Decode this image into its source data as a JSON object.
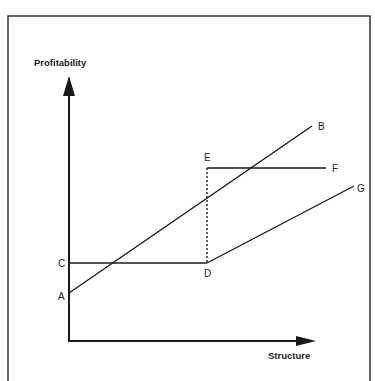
{
  "caption": "",
  "diagram": {
    "y_axis_label": "Profitability",
    "x_axis_label": "Structure",
    "points": {
      "A": {
        "label": "A"
      },
      "B": {
        "label": "B"
      },
      "C": {
        "label": "C"
      },
      "D": {
        "label": "D"
      },
      "E": {
        "label": "E"
      },
      "F": {
        "label": "F"
      },
      "G": {
        "label": "G"
      }
    },
    "lines": [
      {
        "id": "AB",
        "from": "A",
        "to": "B",
        "style": "solid"
      },
      {
        "id": "CD",
        "from": "C",
        "to": "D",
        "style": "solid"
      },
      {
        "id": "DG",
        "from": "D",
        "to": "G",
        "style": "solid"
      },
      {
        "id": "EF",
        "from": "E",
        "to": "F",
        "style": "solid"
      },
      {
        "id": "DE",
        "from": "D",
        "to": "E",
        "style": "dashed"
      }
    ],
    "colors": {
      "ink": "#1a1a1a",
      "frame": "#333333",
      "background": "#ffffff"
    }
  }
}
